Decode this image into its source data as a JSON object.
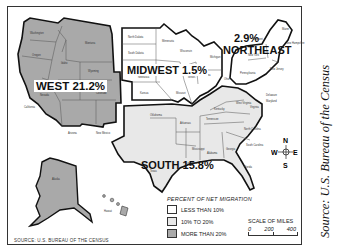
{
  "map": {
    "title": "Net Migration by U.S. Region",
    "regions": [
      {
        "name": "WEST",
        "percent": "21.2%",
        "label": "WEST 21.2%",
        "category": "MORE THAN 20%"
      },
      {
        "name": "MIDWEST",
        "percent": "1.5%",
        "label": "MIDWEST 1.5%",
        "category": "LESS THAN 10%"
      },
      {
        "name": "NORTHEAST",
        "percent": "2.9%",
        "label_name": "NORTHEAST",
        "label_pct": "2.9%",
        "category": "LESS THAN 10%"
      },
      {
        "name": "SOUTH",
        "percent": "15.8%",
        "label": "SOUTH 15.8%",
        "category": "10% TO 20%"
      }
    ],
    "legend": {
      "title": "PERCENT OF NET MIGRATION",
      "items": [
        {
          "label": "LESS THAN 10%",
          "color": "#ffffff"
        },
        {
          "label": "10% TO 20%",
          "color": "#e8e8e8"
        },
        {
          "label": "MORE THAN 20%",
          "color": "#a9a9a9"
        }
      ]
    },
    "scale": {
      "title": "SCALE OF MILES",
      "ticks": [
        "0",
        "200",
        "400"
      ]
    },
    "compass": {
      "n": "N",
      "s": "S",
      "e": "E",
      "w": "W"
    },
    "source_small": "SOURCE: U.S. BUREAU OF THE CENSUS",
    "source_caption": "Source: U.S. Bureau of the Census",
    "colors": {
      "west": "#a9a9a9",
      "south": "#e8e8e8",
      "midwest": "#ffffff",
      "northeast": "#ffffff",
      "border": "#111111"
    }
  }
}
